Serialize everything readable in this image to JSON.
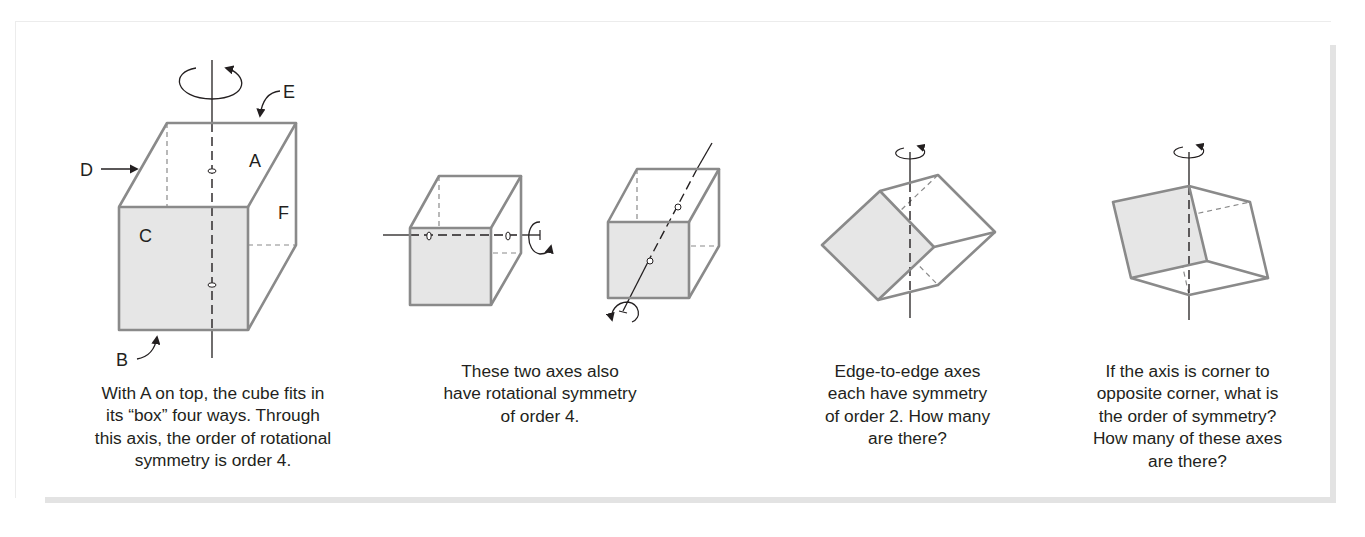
{
  "figure": {
    "colors": {
      "edge": "#8a8a8a",
      "shaded_face": "#e6e6e6",
      "axis": "#231f20",
      "text": "#231f20",
      "panel_shadow": "#e3e3e3"
    },
    "panels": [
      {
        "id": "face-axis-vertical",
        "labels": {
          "A": "A",
          "B": "B",
          "C": "C",
          "D": "D",
          "E": "E",
          "F": "F"
        },
        "caption": "With A on top, the cube fits in\nits “box” four ways. Through\nthis axis, the order of rotational\nsymmetry is order 4."
      },
      {
        "id": "face-axes-other",
        "caption": "These two axes also\nhave rotational symmetry\nof order 4."
      },
      {
        "id": "edge-axes",
        "caption": "Edge-to-edge axes\neach have symmetry\nof order 2. How many\nare there?"
      },
      {
        "id": "corner-axes",
        "caption": "If the axis is corner to\nopposite corner, what is\nthe order of symmetry?\nHow many of these axes\nare there?"
      }
    ]
  }
}
